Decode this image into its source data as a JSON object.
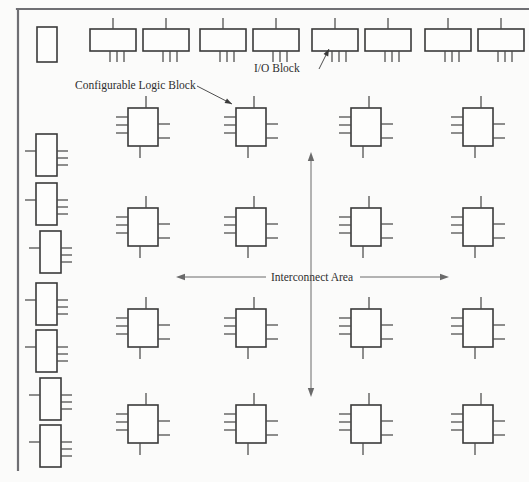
{
  "diagram": {
    "background_color": "#fbfbfa",
    "line_color": "#3a3a3a",
    "frame_color": "#6f6f73",
    "labels": {
      "clb": "Configurable Logic Block",
      "iob": "I/O Block",
      "interconnect": "Interconnect Area"
    }
  },
  "legend_callouts": [
    {
      "id": "clb-callout",
      "text": "Configurable Logic Block",
      "text_x": 75,
      "text_y": 89,
      "leader": {
        "x1": 197,
        "y1": 86,
        "x2": 232,
        "y2": 104
      }
    },
    {
      "id": "iob-callout",
      "text": "I/O Block",
      "text_x": 254,
      "text_y": 72,
      "leader": {
        "x1": 319,
        "y1": 69,
        "x2": 329,
        "y2": 49
      }
    }
  ],
  "dimension_arrows": [
    {
      "id": "interconnect-horizontal",
      "orientation": "horizontal",
      "label": "Interconnect Area",
      "x1": 176,
      "x2": 449,
      "y": 277,
      "label_x": 312,
      "label_y": 281,
      "gap_left": 266,
      "gap_right": 360
    },
    {
      "id": "interconnect-vertical",
      "orientation": "vertical",
      "label": "",
      "x": 311,
      "y1": 152,
      "y2": 397
    }
  ],
  "frame": {
    "top": {
      "x1": 17,
      "y1": 9,
      "x2": 528,
      "y2": 9
    },
    "left": {
      "x1": 18,
      "y1": 9,
      "x2": 18,
      "y2": 470
    }
  },
  "blocks": {
    "corner_block": {
      "name": "corner-block",
      "x": 37,
      "y": 27,
      "w": 20,
      "h": 35
    },
    "top_io_geometry": {
      "w": 46,
      "h": 22,
      "top_pins": 1,
      "bottom_pins": 3,
      "pin_len": 11
    },
    "top_io_blocks": [
      {
        "name": "io-block-top-1",
        "x": 90,
        "y": 29
      },
      {
        "name": "io-block-top-2",
        "x": 143,
        "y": 29
      },
      {
        "name": "io-block-top-3",
        "x": 200,
        "y": 29
      },
      {
        "name": "io-block-top-4",
        "x": 253,
        "y": 29
      },
      {
        "name": "io-block-top-5",
        "x": 312,
        "y": 29
      },
      {
        "name": "io-block-top-6",
        "x": 365,
        "y": 29
      },
      {
        "name": "io-block-top-7",
        "x": 425,
        "y": 29
      },
      {
        "name": "io-block-top-8",
        "x": 478,
        "y": 29
      }
    ],
    "left_io_geometry": {
      "w": 21,
      "h": 42,
      "left_pins": 1,
      "right_pins": 3,
      "pin_len": 11
    },
    "left_io_blocks": [
      {
        "name": "io-block-left-1",
        "x": 36,
        "y": 134
      },
      {
        "name": "io-block-left-2",
        "x": 36,
        "y": 183
      },
      {
        "name": "io-block-left-3",
        "x": 40,
        "y": 231
      },
      {
        "name": "io-block-left-4",
        "x": 36,
        "y": 283
      },
      {
        "name": "io-block-left-5",
        "x": 36,
        "y": 330
      },
      {
        "name": "io-block-left-6",
        "x": 40,
        "y": 378
      },
      {
        "name": "io-block-left-7",
        "x": 40,
        "y": 425
      }
    ],
    "clb_geometry": {
      "w": 30,
      "h": 38,
      "top_pins": 1,
      "bottom_pins": 1,
      "left_pins": 3,
      "right_pins": 2,
      "pin_len": 12
    },
    "clb_columns": [
      128,
      236,
      351,
      463
    ],
    "clb_rows": [
      108,
      208,
      309,
      405
    ],
    "clb_blocks": [
      {
        "name": "clb-r1-c1",
        "x": 128,
        "y": 108
      },
      {
        "name": "clb-r1-c2",
        "x": 236,
        "y": 108
      },
      {
        "name": "clb-r1-c3",
        "x": 351,
        "y": 108
      },
      {
        "name": "clb-r1-c4",
        "x": 463,
        "y": 108
      },
      {
        "name": "clb-r2-c1",
        "x": 128,
        "y": 208
      },
      {
        "name": "clb-r2-c2",
        "x": 236,
        "y": 208
      },
      {
        "name": "clb-r2-c3",
        "x": 351,
        "y": 208
      },
      {
        "name": "clb-r2-c4",
        "x": 463,
        "y": 208
      },
      {
        "name": "clb-r3-c1",
        "x": 128,
        "y": 309
      },
      {
        "name": "clb-r3-c2",
        "x": 236,
        "y": 309
      },
      {
        "name": "clb-r3-c3",
        "x": 351,
        "y": 309
      },
      {
        "name": "clb-r3-c4",
        "x": 463,
        "y": 309
      },
      {
        "name": "clb-r4-c1",
        "x": 128,
        "y": 405
      },
      {
        "name": "clb-r4-c2",
        "x": 236,
        "y": 405
      },
      {
        "name": "clb-r4-c3",
        "x": 351,
        "y": 405
      },
      {
        "name": "clb-r4-c4",
        "x": 463,
        "y": 405
      }
    ]
  }
}
